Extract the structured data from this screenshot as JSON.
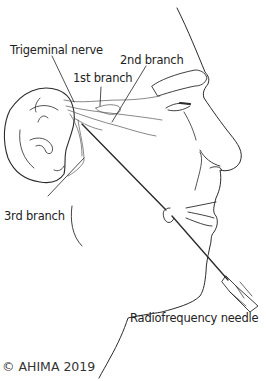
{
  "figure": {
    "labels": {
      "trigeminal_nerve": "Trigeminal nerve",
      "first_branch": "1st branch",
      "second_branch": "2nd branch",
      "third_branch": "3rd branch",
      "needle": "Radiofrequency needle"
    },
    "copyright": "© AHIMA 2019",
    "colors": {
      "line": "#2a2a2a",
      "text": "#222222",
      "background": "#ffffff"
    }
  }
}
